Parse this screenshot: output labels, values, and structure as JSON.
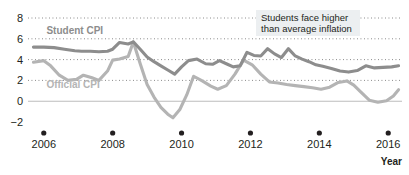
{
  "chart_data": {
    "type": "line",
    "title": "",
    "xlabel": "Year",
    "ylabel": "",
    "xlim": [
      2005.6,
      2016.4
    ],
    "ylim": [
      -2,
      8
    ],
    "grid": true,
    "gridlines": [
      2,
      4,
      6,
      8
    ],
    "zero_line": 0,
    "legend_position": "inline-labels",
    "yticks": [
      "8",
      "6",
      "4",
      "2",
      "0",
      "−2"
    ],
    "ytick_values": [
      8,
      6,
      4,
      2,
      0,
      -2
    ],
    "xticks": [
      "2006",
      "2008",
      "2010",
      "2012",
      "2014",
      "2016"
    ],
    "xtick_values": [
      2006,
      2008,
      2010,
      2012,
      2014,
      2016
    ],
    "annotation": {
      "line1": "Students face higher",
      "line2": "than average inflation"
    },
    "series": [
      {
        "name": "Student CPI",
        "color": "#8d8d8d",
        "label_x": 2006.9,
        "label_y": 6.45,
        "x": [
          2005.7,
          2006.0,
          2006.3,
          2006.6,
          2006.9,
          2007.1,
          2007.35,
          2007.6,
          2007.85,
          2008.0,
          2008.2,
          2008.45,
          2008.6,
          2008.8,
          2009.0,
          2009.2,
          2009.4,
          2009.6,
          2009.8,
          2010.0,
          2010.2,
          2010.45,
          2010.7,
          2010.9,
          2011.1,
          2011.3,
          2011.5,
          2011.7,
          2011.9,
          2012.1,
          2012.3,
          2012.5,
          2012.7,
          2012.9,
          2013.1,
          2013.3,
          2013.5,
          2013.7,
          2013.9,
          2014.1,
          2014.35,
          2014.6,
          2014.85,
          2015.1,
          2015.35,
          2015.6,
          2015.85,
          2016.1,
          2016.3
        ],
        "y": [
          5.2,
          5.2,
          5.15,
          5.0,
          4.85,
          4.8,
          4.8,
          4.75,
          4.8,
          5.0,
          5.65,
          5.5,
          5.7,
          5.0,
          4.25,
          3.8,
          3.4,
          3.0,
          2.6,
          3.3,
          3.9,
          4.05,
          3.6,
          3.55,
          3.9,
          3.6,
          3.3,
          3.4,
          4.7,
          4.4,
          4.35,
          5.05,
          4.55,
          4.2,
          5.05,
          4.35,
          4.05,
          3.8,
          3.5,
          3.35,
          3.15,
          2.9,
          2.8,
          2.95,
          3.4,
          3.2,
          3.25,
          3.3,
          3.4
        ]
      },
      {
        "name": "Official CPI",
        "color": "#b4b4b4",
        "label_x": 2006.85,
        "label_y": 1.25,
        "x": [
          2005.7,
          2006.0,
          2006.2,
          2006.45,
          2006.7,
          2006.95,
          2007.15,
          2007.4,
          2007.6,
          2007.85,
          2008.0,
          2008.2,
          2008.45,
          2008.6,
          2008.8,
          2009.0,
          2009.2,
          2009.4,
          2009.6,
          2009.75,
          2009.95,
          2010.15,
          2010.35,
          2010.6,
          2010.85,
          2011.05,
          2011.3,
          2011.55,
          2011.8,
          2012.05,
          2012.3,
          2012.55,
          2012.8,
          2013.05,
          2013.3,
          2013.55,
          2013.8,
          2014.05,
          2014.3,
          2014.55,
          2014.8,
          2015.0,
          2015.2,
          2015.45,
          2015.7,
          2015.95,
          2016.15,
          2016.3
        ],
        "y": [
          3.75,
          3.9,
          3.4,
          2.5,
          2.0,
          2.1,
          2.5,
          2.25,
          2.0,
          2.9,
          3.95,
          4.05,
          4.3,
          5.7,
          3.6,
          1.6,
          0.4,
          -0.6,
          -1.25,
          -1.6,
          -0.8,
          0.6,
          2.4,
          1.95,
          1.45,
          1.15,
          1.5,
          2.6,
          3.95,
          3.5,
          2.6,
          1.85,
          1.75,
          1.6,
          1.5,
          1.4,
          1.3,
          1.15,
          1.35,
          1.8,
          1.95,
          1.55,
          0.9,
          0.1,
          -0.1,
          0.05,
          0.5,
          1.1
        ]
      }
    ]
  },
  "axis": {
    "year_label": "Year"
  }
}
